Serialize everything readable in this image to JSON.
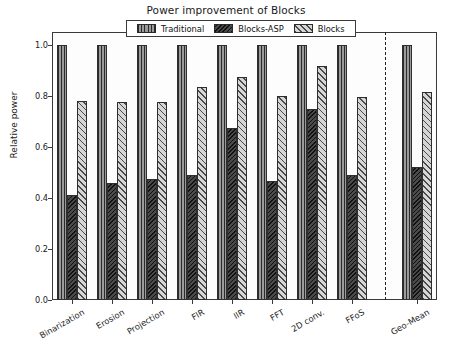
{
  "chart_data": {
    "type": "bar",
    "title": "Power improvement of Blocks",
    "xlabel": "",
    "ylabel": "Relative power",
    "ylim": [
      0.0,
      1.05
    ],
    "yticks": [
      "0.0",
      "0.2",
      "0.4",
      "0.6",
      "0.8",
      "1.0"
    ],
    "ytick_values": [
      0.0,
      0.2,
      0.4,
      0.6,
      0.8,
      1.0
    ],
    "grid": false,
    "legend_position": "upper center",
    "categories": [
      "Binarization",
      "Erosion",
      "Projection",
      "FIR",
      "IIR",
      "FFT",
      "2D conv.",
      "FFoS",
      "Geo-Mean"
    ],
    "series": [
      {
        "name": "Traditional",
        "hatch": "vertical",
        "color": "#9a9a9a",
        "values": [
          1.0,
          1.0,
          1.0,
          1.0,
          1.0,
          1.0,
          1.0,
          1.0,
          1.0
        ]
      },
      {
        "name": "Blocks-ASP",
        "hatch": "dense-diagonal-dark",
        "color": "#4a4a4a",
        "values": [
          0.41,
          0.46,
          0.475,
          0.49,
          0.675,
          0.465,
          0.75,
          0.49,
          0.52
        ]
      },
      {
        "name": "Blocks",
        "hatch": "light-diagonal",
        "color": "#d6d6d6",
        "values": [
          0.78,
          0.775,
          0.775,
          0.835,
          0.875,
          0.8,
          0.915,
          0.795,
          0.815
        ]
      }
    ],
    "separator_after_category": "FFoS",
    "separator_style": "dashed"
  }
}
